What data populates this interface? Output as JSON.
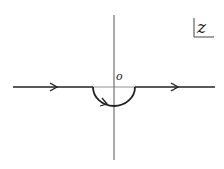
{
  "diagram": {
    "type": "contour-integration-path",
    "plane_label": "z",
    "origin_label": "o",
    "colors": {
      "stroke": "#222222",
      "axis": "#555555",
      "background": "#ffffff"
    },
    "elements": [
      {
        "id": "real-axis-left",
        "kind": "line",
        "from": [
          13,
          87
        ],
        "to": [
          93,
          87
        ],
        "arrow_at": 55,
        "direction": "right"
      },
      {
        "id": "indent-semicircle",
        "kind": "arc",
        "center": [
          114,
          87
        ],
        "radius": 21,
        "side": "below",
        "direction": "left-to-right"
      },
      {
        "id": "real-axis-right",
        "kind": "line",
        "from": [
          135,
          87
        ],
        "to": [
          215,
          87
        ],
        "arrow_at": 175,
        "direction": "right"
      },
      {
        "id": "imaginary-axis",
        "kind": "line",
        "from": [
          114,
          15
        ],
        "to": [
          114,
          160
        ]
      }
    ]
  }
}
